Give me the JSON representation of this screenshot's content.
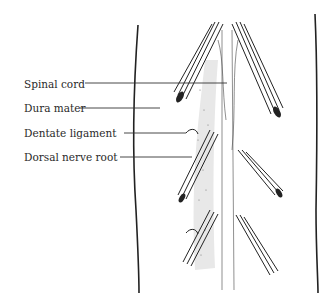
{
  "figure": {
    "labels": [
      {
        "text": "Spinal cord",
        "y": 78
      },
      {
        "text": "Dura mater",
        "y": 102
      },
      {
        "text": "Dentate ligament",
        "y": 126
      },
      {
        "text": "Dorsal nerve root",
        "y": 150
      }
    ]
  }
}
